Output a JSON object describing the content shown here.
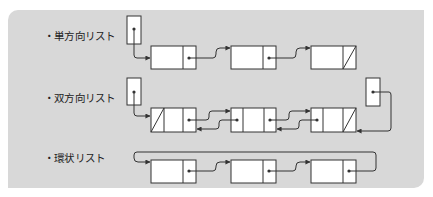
{
  "diagram": {
    "colors": {
      "panel_bg": "#d8d8d8",
      "node_fill": "#ffffff",
      "stroke": "#333333"
    },
    "sections": [
      {
        "id": "singly",
        "label": "・単方向リスト",
        "head_pointer": true,
        "nodes": 3,
        "node_fields": [
          "data",
          "next"
        ],
        "last_next": "null"
      },
      {
        "id": "doubly",
        "label": "・双方向リスト",
        "head_pointer": true,
        "tail_pointer": true,
        "nodes": 3,
        "node_fields": [
          "prev",
          "data",
          "next"
        ],
        "first_prev": "null",
        "last_next": "null"
      },
      {
        "id": "circular",
        "label": "・環状リスト",
        "nodes": 3,
        "node_fields": [
          "data",
          "next"
        ],
        "last_next": "first"
      }
    ]
  }
}
